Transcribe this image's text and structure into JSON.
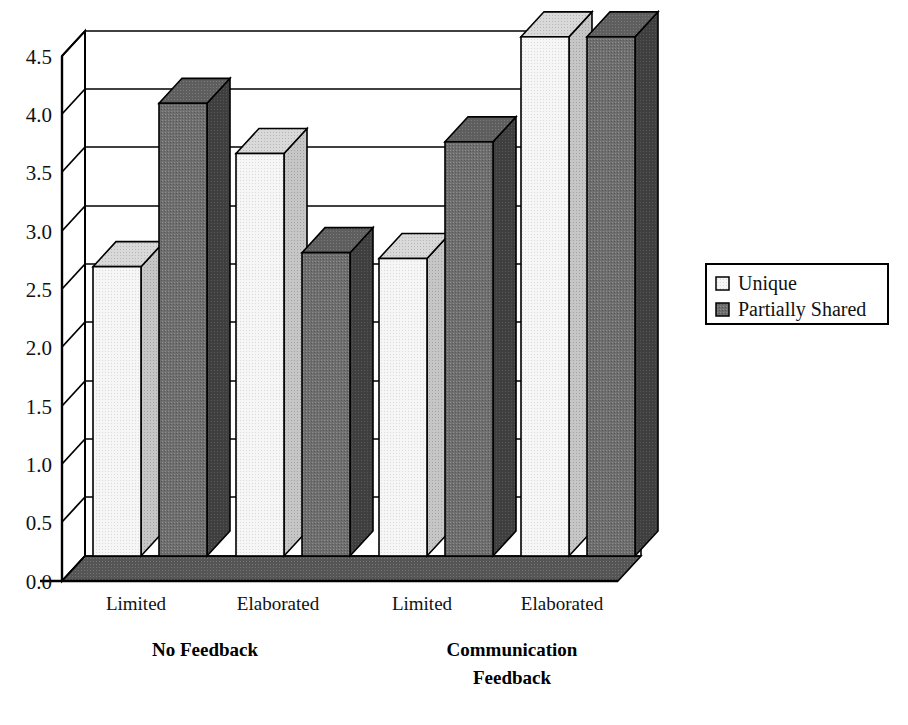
{
  "chart_data": {
    "type": "bar",
    "title": "",
    "subtitle": "",
    "xlabel": "",
    "ylabel": "",
    "grid": true,
    "three_d": true,
    "legend_position": "right",
    "ylim": [
      0.0,
      4.5
    ],
    "ytick_step": 0.5,
    "ytick_labels": [
      "0.0",
      "0.5",
      "1.0",
      "1.5",
      "2.0",
      "2.5",
      "3.0",
      "3.5",
      "4.0",
      "4.5"
    ],
    "ytick_values": [
      0.0,
      0.5,
      1.0,
      1.5,
      2.0,
      2.5,
      3.0,
      3.5,
      4.0,
      4.5
    ],
    "categories": [
      "Limited",
      "Elaborated",
      "Limited",
      "Elaborated"
    ],
    "group_labels": [
      "No Feedback",
      "Communication Feedback"
    ],
    "group_label_lines": [
      [
        "No Feedback"
      ],
      [
        "Communication",
        "Feedback"
      ]
    ],
    "groups": [
      {
        "name": "No Feedback",
        "categories": [
          "Limited",
          "Elaborated"
        ]
      },
      {
        "name": "Communication Feedback",
        "categories": [
          "Limited",
          "Elaborated"
        ]
      }
    ],
    "series": [
      {
        "name": "Unique",
        "color": "#f2f2f2",
        "values": [
          2.48,
          3.45,
          2.55,
          4.45
        ]
      },
      {
        "name": "Partially Shared",
        "color": "#666666",
        "values": [
          3.88,
          2.6,
          3.55,
          4.45
        ]
      }
    ]
  },
  "legend": {
    "entries": [
      {
        "label": "Unique",
        "swatch": "#f2f2f2"
      },
      {
        "label": "Partially Shared",
        "swatch": "#666666"
      }
    ]
  },
  "axis": {
    "y_ticks": [
      "4.5",
      "4.0",
      "3.5",
      "3.0",
      "2.5",
      "2.0",
      "1.5",
      "1.0",
      "0.5",
      "0.0"
    ]
  },
  "colors": {
    "bar_light_front": "#f2f2f2",
    "bar_light_top": "#d4d4d4",
    "bar_light_side": "#bdbdbd",
    "bar_dark_front": "#6e6e6e",
    "bar_dark_top": "#595959",
    "bar_dark_side": "#414141",
    "floor": "#555555",
    "wall": "#ffffff",
    "line": "#000000"
  }
}
